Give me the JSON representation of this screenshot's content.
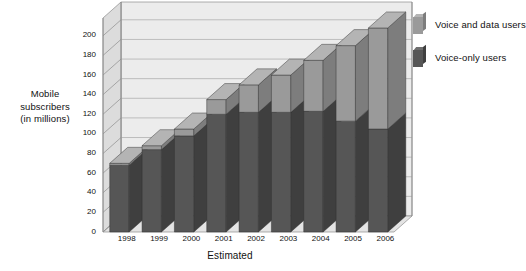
{
  "chart_data": {
    "type": "bar",
    "subtype": "stacked-3d-column",
    "title": "",
    "xlabel": "Estimated",
    "ylabel": "Mobile subscribers (in millions)",
    "ylabel_lines": [
      "Mobile",
      "subscribers",
      "(in millions)"
    ],
    "categories": [
      "1998",
      "1999",
      "2000",
      "2001",
      "2002",
      "2003",
      "2004",
      "2005",
      "2006"
    ],
    "series": [
      {
        "name": "Voice-only users",
        "color": "#565656",
        "values": [
          68,
          84,
          98,
          120,
          122,
          122,
          123,
          113,
          105
        ]
      },
      {
        "name": "Voice and data users",
        "color": "#9a9a9a",
        "values": [
          2,
          4,
          7,
          15,
          28,
          38,
          52,
          77,
          103
        ]
      }
    ],
    "totals": [
      70,
      88,
      105,
      135,
      150,
      160,
      175,
      190,
      208
    ],
    "yticks": [
      0,
      20,
      40,
      60,
      80,
      100,
      120,
      140,
      160,
      180,
      200
    ],
    "ylim": [
      0,
      210
    ],
    "grid": true,
    "legend_position": "right",
    "legend": [
      {
        "label": "Voice and data users",
        "color": "#9a9a9a"
      },
      {
        "label": "Voice-only users",
        "color": "#565656"
      }
    ]
  },
  "colors": {
    "bar_dark_front": "#565656",
    "bar_dark_top": "#6e6e6e",
    "bar_dark_side": "#3f3f3f",
    "bar_light_front": "#9a9a9a",
    "bar_light_top": "#b4b4b4",
    "bar_light_side": "#7d7d7d",
    "plot_back": "#ececec",
    "plot_floor": "#e4e4e4",
    "plot_sidewall": "#dcdcdc",
    "gridline": "#a8a8a8",
    "axis": "#8c8c8c",
    "text": "#111111"
  }
}
